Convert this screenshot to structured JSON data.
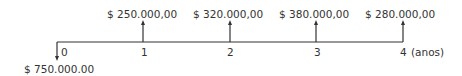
{
  "diagram": {
    "type": "cash-flow-timeline",
    "unit_label": "(anos)",
    "outflow": {
      "period": "0",
      "value": "$ 750.000.00"
    },
    "periods": [
      {
        "label": "0",
        "inflow": null
      },
      {
        "label": "1",
        "inflow": "$ 250.000,00"
      },
      {
        "label": "2",
        "inflow": "$ 320.000,00"
      },
      {
        "label": "3",
        "inflow": "$ 380.000,00"
      },
      {
        "label": "4",
        "inflow": "$ 280.000,00"
      }
    ],
    "line_color": "#333333"
  }
}
